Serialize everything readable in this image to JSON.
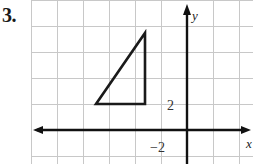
{
  "problem": {
    "number": "3."
  },
  "graph": {
    "axis_labels": {
      "x": "x",
      "y": "y"
    },
    "tick_labels": {
      "y_two": "2",
      "x_neg_two": "−2"
    },
    "colors": {
      "grid": "#c8c8c8",
      "axis": "#111111",
      "shape": "#1a1a1a",
      "background": "#ffffff"
    },
    "grid": {
      "cell_size": 26,
      "origin_x": 187,
      "origin_y": 130
    },
    "shape": {
      "name": "right-triangle",
      "vertices": [
        {
          "x": 96,
          "y": 104
        },
        {
          "x": 145,
          "y": 104
        },
        {
          "x": 145,
          "y": 33
        }
      ]
    }
  }
}
